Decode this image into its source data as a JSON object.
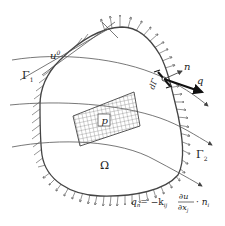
{
  "diagram": {
    "labels": {
      "u0": "u",
      "u0_sup": "0",
      "gamma1": "Γ",
      "gamma1_sub": "1",
      "gamma2": "Γ",
      "gamma2_sub": "2",
      "omega": "Ω",
      "p": "p",
      "n": "n",
      "q": "q",
      "dGamma": "dΓ"
    },
    "formula": {
      "lhs": "q",
      "lhs_sub": "n",
      "eq": "= −k",
      "k_sub": "ij",
      "num": "∂u",
      "den": "∂x",
      "den_sub": "j",
      "tail": "· n",
      "tail_sub": "i"
    },
    "colors": {
      "stroke": "#444444",
      "text": "#222222",
      "background": "#ffffff"
    }
  }
}
